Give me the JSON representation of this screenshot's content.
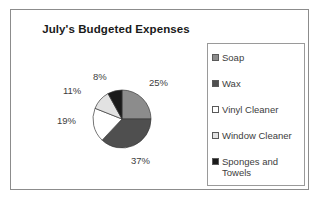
{
  "chart_data": {
    "type": "pie",
    "title": "July's Budgeted Expenses",
    "categories": [
      "Soap",
      "Wax",
      "Vinyl Cleaner",
      "Window Cleaner",
      "Sponges and Towels"
    ],
    "values": [
      25,
      37,
      19,
      11,
      8
    ],
    "value_labels": [
      "25%",
      "37%",
      "19%",
      "11%",
      "8%"
    ],
    "units": "percent",
    "colors": [
      "#8c8c8c",
      "#4f4f4f",
      "#ffffff",
      "#e2e2e2",
      "#1a1a1a"
    ],
    "legend_position": "right",
    "grid": false,
    "xlabel": "",
    "ylabel": ""
  },
  "frame": {
    "border_color": "#8c8c8c",
    "background": "#ffffff"
  },
  "legend": {
    "items": [
      {
        "label": "Soap",
        "swatch": "legend-swatch-soap",
        "color": "#8c8c8c"
      },
      {
        "label": "Wax",
        "swatch": "legend-swatch-wax",
        "color": "#4f4f4f"
      },
      {
        "label": "Vinyl Cleaner",
        "swatch": "legend-swatch-vinyl-cleaner",
        "color": "#ffffff"
      },
      {
        "label": "Window Cleaner",
        "swatch": "legend-swatch-window-cleaner",
        "color": "#e2e2e2"
      },
      {
        "label": "Sponges and\nTowels",
        "swatch": "legend-swatch-sponges-and-towels",
        "color": "#1a1a1a"
      }
    ]
  },
  "pie_labels": [
    {
      "text": "25%",
      "left": 138,
      "top": 42
    },
    {
      "text": "37%",
      "left": 120,
      "top": 120
    },
    {
      "text": "19%",
      "left": 46,
      "top": 80
    },
    {
      "text": "11%",
      "left": 52,
      "top": 50
    },
    {
      "text": "8%",
      "left": 82,
      "top": 36
    }
  ]
}
